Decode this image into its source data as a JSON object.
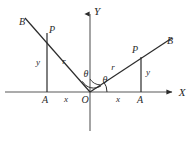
{
  "figure": {
    "type": "geometry-diagram",
    "background_color": "#ffffff",
    "line_color": "#2b2b2b",
    "axis_color": "#3a3a3a",
    "width": 191,
    "height": 144
  },
  "axes": {
    "x_label": "X",
    "y_label": "Y",
    "origin_label": "O",
    "x_axis": {
      "x1": 5,
      "y1": 92,
      "x2": 176,
      "y2": 92,
      "arrow": "right"
    },
    "y_axis": {
      "x1": 90,
      "y1": 10,
      "x2": 90,
      "y2": 131,
      "arrow": "up"
    },
    "x_label_pos": {
      "x": 182,
      "y": 92
    },
    "y_label_pos": {
      "x": 97,
      "y": 11
    },
    "origin_label_pos": {
      "x": 85,
      "y": 100
    }
  },
  "left_triangle": {
    "ray_label_b": "B",
    "point_label_p": "P",
    "foot_label_a": "A",
    "leg_vertical_label": "y",
    "leg_horizontal_label": "x",
    "hypotenuse_label": "r",
    "origin": {
      "x": 90,
      "y": 92
    },
    "point_p": {
      "x": 47,
      "y": 33
    },
    "ray_end_b": {
      "x": 25,
      "y": 18
    },
    "foot_a": {
      "x": 47,
      "y": 92
    },
    "label_b_pos": {
      "x": 22,
      "y": 22
    },
    "label_p_pos": {
      "x": 52,
      "y": 30
    },
    "label_a_pos": {
      "x": 45,
      "y": 100
    },
    "label_y_pos": {
      "x": 38,
      "y": 62
    },
    "label_x_pos": {
      "x": 66,
      "y": 99
    },
    "label_r_pos": {
      "x": 64,
      "y": 61
    }
  },
  "right_triangle": {
    "ray_label_b": "B",
    "point_label_p": "P",
    "foot_label_a": "A",
    "leg_vertical_label": "y",
    "leg_horizontal_label": "x",
    "hypotenuse_label": "r",
    "origin": {
      "x": 90,
      "y": 92
    },
    "point_p": {
      "x": 141,
      "y": 57
    },
    "ray_end_b": {
      "x": 172,
      "y": 38
    },
    "foot_a": {
      "x": 141,
      "y": 92
    },
    "label_b_pos": {
      "x": 170,
      "y": 41
    },
    "label_p_pos": {
      "x": 135,
      "y": 50
    },
    "label_a_pos": {
      "x": 140,
      "y": 100
    },
    "label_y_pos": {
      "x": 148,
      "y": 72
    },
    "label_x_pos": {
      "x": 118,
      "y": 99
    },
    "label_r_pos": {
      "x": 113,
      "y": 67
    }
  },
  "angles": {
    "theta_upper_label": "θ",
    "theta_lower_label": "θ",
    "theta_upper_pos": {
      "x": 86,
      "y": 74
    },
    "theta_lower_pos": {
      "x": 105,
      "y": 80
    },
    "arc_at_origin_radius": 13,
    "arc_small_radius": 17
  }
}
